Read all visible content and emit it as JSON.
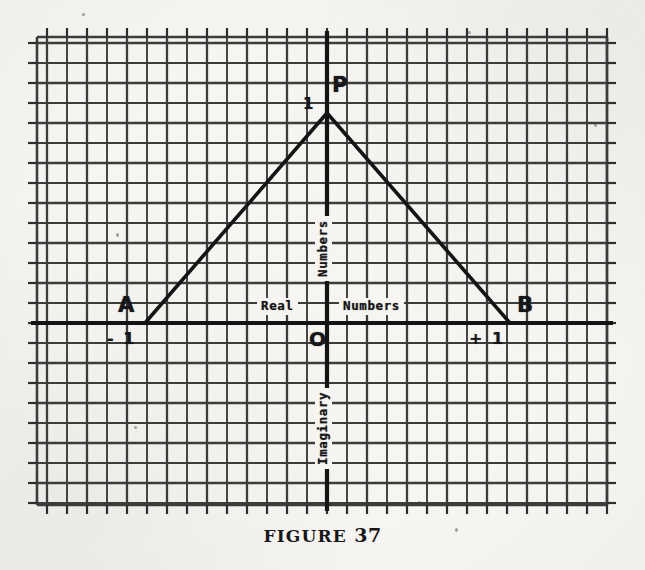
{
  "figure": {
    "caption_word": "FIGURE",
    "caption_number": "37"
  },
  "axes": {
    "real_label_left": "Real",
    "real_label_right": "Numbers",
    "imaginary_upper_label": "Numbers",
    "imaginary_lower_label": "Imaginary",
    "origin_label": "O"
  },
  "points": {
    "apex_label": "P",
    "apex_value": "1",
    "left_vertex_label": "A",
    "left_vertex_value": "- 1",
    "right_vertex_label": "B",
    "right_vertex_value": "+ 1"
  },
  "colors": {
    "paper": "#f7f5f1",
    "grid_line": "#3c3c3c",
    "axis_line": "#141414",
    "ink": "#17171a"
  },
  "chart_data": {
    "type": "scatter",
    "title": "FIGURE 37",
    "xlabel": "Real Numbers",
    "ylabel": "Imaginary Numbers",
    "xlim": [
      -14.5,
      14
    ],
    "ylim": [
      -9.1,
      14.3
    ],
    "grid": true,
    "grid_spacing": 1,
    "legend": "none",
    "points": [
      {
        "name": "A",
        "label": "A",
        "x": -9,
        "y": 0,
        "value_label": "- 1"
      },
      {
        "name": "O",
        "label": "O",
        "x": 0,
        "y": 0,
        "value_label": "O"
      },
      {
        "name": "B",
        "label": "B",
        "x": 9,
        "y": 0,
        "value_label": "+ 1"
      },
      {
        "name": "P",
        "label": "P",
        "x": 0,
        "y": 10.5,
        "value_label": "1"
      }
    ],
    "series": [
      {
        "name": "segment-AP",
        "type": "line",
        "x": [
          -9,
          0
        ],
        "y": [
          0,
          10.5
        ]
      },
      {
        "name": "segment-PB",
        "type": "line",
        "x": [
          0,
          9
        ],
        "y": [
          10.5,
          0
        ]
      }
    ],
    "annotations": [
      {
        "text": "Real",
        "x": -3.6,
        "y": 0.7
      },
      {
        "text": "Numbers",
        "x": 2.6,
        "y": 0.7
      },
      {
        "text": "Numbers",
        "x": -0.7,
        "y": 4.2,
        "rotation": 90
      },
      {
        "text": "Imaginary",
        "x": -0.7,
        "y": -5.0,
        "rotation": 90
      }
    ]
  }
}
